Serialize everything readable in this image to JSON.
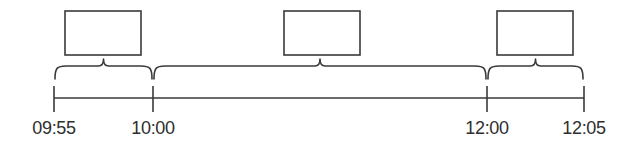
{
  "timeline": {
    "axis": {
      "y": 98,
      "x_start": 54,
      "x_end": 584,
      "color": "#3a3a3a"
    },
    "ticks": [
      {
        "label": "09:55",
        "x": 54
      },
      {
        "label": "10:00",
        "x": 153
      },
      {
        "label": "12:00",
        "x": 487
      },
      {
        "label": "12:05",
        "x": 584
      }
    ],
    "segments": [
      {
        "from": "09:55",
        "to": "10:00",
        "x1": 54,
        "x2": 153,
        "box": {
          "x": 65,
          "y": 11,
          "w": 76,
          "h": 44,
          "label": ""
        }
      },
      {
        "from": "10:00",
        "to": "12:00",
        "x1": 153,
        "x2": 487,
        "box": {
          "x": 284,
          "y": 11,
          "w": 76,
          "h": 44,
          "label": ""
        }
      },
      {
        "from": "12:00",
        "to": "12:05",
        "x1": 487,
        "x2": 584,
        "box": {
          "x": 497,
          "y": 11,
          "w": 76,
          "h": 44,
          "label": ""
        }
      }
    ]
  }
}
